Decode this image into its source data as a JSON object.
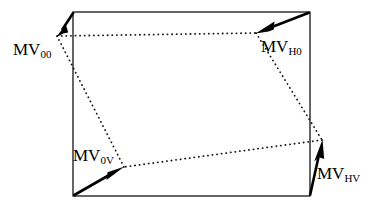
{
  "figure": {
    "type": "vector-field-diagram",
    "background_color": "#ffffff",
    "stroke_color": "#000000"
  },
  "block": {
    "name": "macroblock-rectangle",
    "x": 73,
    "y": 12,
    "width": 237,
    "height": 184,
    "stroke_width": 1.2,
    "corners": {
      "top_left": [
        73,
        12
      ],
      "top_right": [
        310,
        12
      ],
      "bottom_left": [
        73,
        196
      ],
      "bottom_right": [
        310,
        196
      ]
    }
  },
  "warped_quad": {
    "name": "dotted-quadrilateral",
    "style": "dotted",
    "dot_radius": 0.9,
    "dot_spacing": 4.4,
    "vertices": {
      "top_left": [
        57,
        36
      ],
      "top_right": [
        256,
        33
      ],
      "bottom_right": [
        322,
        140
      ],
      "bottom_left": [
        124,
        167
      ]
    }
  },
  "vectors": [
    {
      "id": "mv00",
      "label_main": "MV",
      "label_sub": "00",
      "from": [
        73,
        12
      ],
      "to": [
        57,
        36
      ],
      "label_position": [
        13,
        41
      ],
      "description": "motion vector at top-left corner"
    },
    {
      "id": "mvh0",
      "label_main": "MV",
      "label_sub": "H0",
      "from": [
        310,
        12
      ],
      "to": [
        256,
        33
      ],
      "label_position": [
        261,
        38
      ],
      "description": "motion vector at top-right corner"
    },
    {
      "id": "mv0v",
      "label_main": "MV",
      "label_sub": "0V",
      "from": [
        73,
        196
      ],
      "to": [
        124,
        167
      ],
      "label_position": [
        73,
        147
      ],
      "description": "motion vector at bottom-left corner"
    },
    {
      "id": "mvhv",
      "label_main": "MV",
      "label_sub": "HV",
      "from": [
        310,
        196
      ],
      "to": [
        322,
        140
      ],
      "label_position": [
        317,
        165
      ],
      "description": "motion vector at bottom-right corner"
    }
  ]
}
